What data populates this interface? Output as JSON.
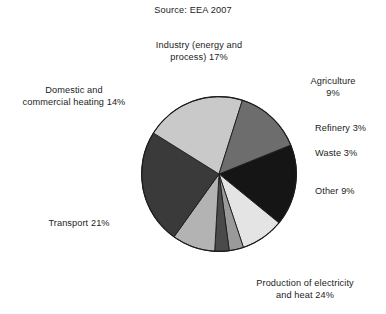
{
  "source_note": "Source: EEA 2007",
  "labels": {
    "industry": "Industry (energy and\nprocess) 17%",
    "agriculture": "Agriculture\n9%",
    "refinery": "Refinery 3%",
    "waste": "Waste 3%",
    "other": "Other 9%",
    "production": "Production of electricity\nand heat 24%",
    "transport": "Transport 21%",
    "domestic": "Domestic and\ncommercial heating 14%"
  },
  "chart_data": {
    "type": "pie",
    "title": "",
    "subtitle": "Source: EEA 2007",
    "xlabel": "",
    "ylabel": "",
    "legend_position": "none",
    "grid": false,
    "start_angle_deg": -22,
    "direction": "clockwise",
    "center": [
      219,
      174
    ],
    "radius": 78,
    "categories": [
      "Industry (energy and process)",
      "Agriculture",
      "Refinery",
      "Waste",
      "Other",
      "Production of electricity and heat",
      "Transport",
      "Domestic and commercial heating"
    ],
    "values": [
      17,
      9,
      3,
      3,
      9,
      24,
      21,
      14
    ],
    "units": "percent",
    "total": 100,
    "colors": [
      "#151515",
      "#e4e4e4",
      "#9a9a9a",
      "#4a4a4a",
      "#b3b3b3",
      "#3a3a3a",
      "#c9c9c9",
      "#6d6d6d"
    ],
    "slice_stroke": "#1c1c1c",
    "annotations": [
      "Industry (energy and process) 17%",
      "Agriculture 9%",
      "Refinery 3%",
      "Waste 3%",
      "Other 9%",
      "Production of electricity and heat 24%",
      "Transport 21%",
      "Domestic and commercial heating 14%"
    ]
  }
}
